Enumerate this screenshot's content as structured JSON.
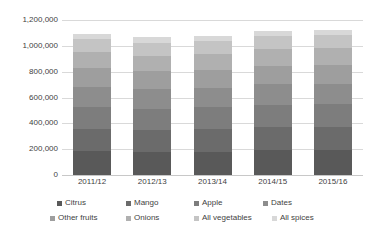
{
  "chart_data": {
    "type": "bar",
    "stacked": true,
    "title": "",
    "xlabel": "",
    "ylabel": "",
    "ylim": [
      0,
      1200000
    ],
    "ytick_step": 200000,
    "ytick_labels": [
      "0",
      "200,000",
      "400,000",
      "600,000",
      "800,000",
      "1,000,000",
      "1,200,000"
    ],
    "ytick_values": [
      0,
      200000,
      400000,
      600000,
      800000,
      1000000,
      1200000
    ],
    "grid": true,
    "legend_position": "bottom",
    "categories": [
      "2011/12",
      "2012/13",
      "2013/14",
      "2014/15",
      "2015/16"
    ],
    "series": [
      {
        "name": "Citrus",
        "color": "#595959",
        "values": [
          185000,
          178000,
          182000,
          190000,
          192000
        ]
      },
      {
        "name": "Mango",
        "color": "#6b6b6b",
        "values": [
          175000,
          172000,
          173000,
          178000,
          180000
        ]
      },
      {
        "name": "Apple",
        "color": "#7d7d7d",
        "values": [
          170000,
          165000,
          168000,
          178000,
          176000
        ]
      },
      {
        "name": "Dates",
        "color": "#8d8d8d",
        "values": [
          155000,
          150000,
          152000,
          158000,
          160000
        ]
      },
      {
        "name": "Other fruits",
        "color": "#9e9e9e",
        "values": [
          140000,
          138000,
          140000,
          144000,
          146000
        ]
      },
      {
        "name": "Onions",
        "color": "#b0b0b0",
        "values": [
          125000,
          122000,
          124000,
          130000,
          130000
        ]
      },
      {
        "name": "All vegetables",
        "color": "#c4c4c4",
        "values": [
          100000,
          98000,
          101000,
          102000,
          102000
        ]
      },
      {
        "name": "All spices",
        "color": "#d8d8d8",
        "values": [
          45000,
          47000,
          40000,
          35000,
          34000
        ]
      }
    ],
    "totals": [
      1095000,
      1070000,
      1080000,
      1115000,
      1120000
    ]
  },
  "legend": {
    "items": [
      {
        "label": "Citrus"
      },
      {
        "label": "Mango"
      },
      {
        "label": "Apple"
      },
      {
        "label": "Dates"
      },
      {
        "label": "Other fruits"
      },
      {
        "label": "Onions"
      },
      {
        "label": "All vegetables"
      },
      {
        "label": "All spices"
      }
    ]
  },
  "colors": {
    "gridline": "#d9d9d9",
    "text": "#3f3f3f",
    "background": "#ffffff"
  }
}
